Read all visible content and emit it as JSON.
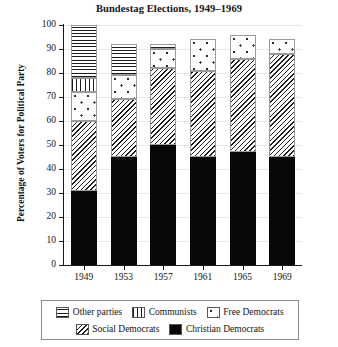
{
  "chart_data": {
    "type": "bar",
    "stacked": true,
    "title": "Bundestag Elections, 1949–1969",
    "xlabel": "",
    "ylabel": "Percentage of Voters for Political Party",
    "categories": [
      "1949",
      "1953",
      "1957",
      "1961",
      "1965",
      "1969"
    ],
    "ylim": [
      0,
      100
    ],
    "ytick_labels": [
      "0",
      "10",
      "20",
      "30",
      "40",
      "50",
      "60",
      "70",
      "80",
      "90",
      "100"
    ],
    "ytick_values": [
      0,
      10,
      20,
      30,
      40,
      50,
      60,
      70,
      80,
      90,
      100
    ],
    "grid": true,
    "legend_position": "bottom",
    "series": [
      {
        "name": "Christian Democrats",
        "pattern": "solid-black",
        "color": "#080808",
        "values": [
          31,
          45,
          50,
          45,
          47,
          45
        ]
      },
      {
        "name": "Social Democrats",
        "pattern": "diagonal-hatch",
        "color": "#1d1d1d",
        "values": [
          29,
          24,
          32,
          36,
          39,
          43
        ]
      },
      {
        "name": "Free Democrats",
        "pattern": "dots",
        "color": "#2a2a2a",
        "values": [
          12,
          10,
          8,
          13,
          10,
          6
        ]
      },
      {
        "name": "Communists",
        "pattern": "vertical-lines",
        "color": "#1d1d1d",
        "values": [
          6,
          0,
          0,
          0,
          0,
          0
        ]
      },
      {
        "name": "Other parties",
        "pattern": "horizontal-lines",
        "color": "#1d1d1d",
        "values": [
          22,
          13,
          2,
          0,
          0,
          0
        ]
      }
    ],
    "bar_totals": [
      100,
      92,
      92,
      94,
      96,
      94
    ]
  },
  "legend": {
    "rows": [
      [
        {
          "label": "Other parties",
          "pattern": "horizontal-lines"
        },
        {
          "label": "Communists",
          "pattern": "vertical-lines"
        },
        {
          "label": "Free Democrats",
          "pattern": "dots"
        }
      ],
      [
        {
          "label": "Social Democrats",
          "pattern": "diagonal-hatch"
        },
        {
          "label": "Christian Democrats",
          "pattern": "solid-black"
        }
      ]
    ]
  }
}
